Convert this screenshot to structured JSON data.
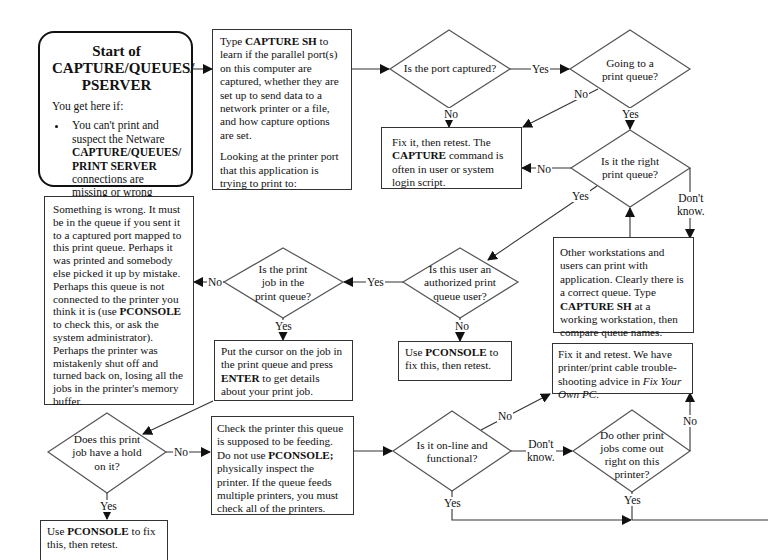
{
  "start": {
    "title_lines": [
      "Start of",
      "CAPTURE/QUEUES/",
      "PSERVER"
    ],
    "subtitle": "You get here if:",
    "bullet_pre": "You can't print and suspect the Netware ",
    "bullet_bold": "CAPTURE/QUEUES/ PRINT SERVER",
    "bullet_post": " connections are missing or wrong"
  },
  "capture_sh_box": {
    "p1_pre": "Type ",
    "p1_bold": "CAPTURE SH",
    "p1_post": " to learn if the parallel port(s) on this computer are captured, whether they are set up to send data to a network printer or a file, and how capture options are set.",
    "p2": "Looking at the printer port that this application is trying to print to:"
  },
  "diamonds": {
    "port_captured": "Is the port captured?",
    "going_to_queue": "Going to a print queue?",
    "right_queue": "Is it the right print queue?",
    "authorized_user": "Is this user an authorized print queue user?",
    "job_in_queue": "Is the print job in the print queue?",
    "job_hold": "Does this print job have a hold on it?",
    "online_functional": "Is it on-line and functional?",
    "other_jobs_ok": "Do other print jobs come out right on this printer?"
  },
  "boxes": {
    "fix_retest_capture": {
      "pre": "Fix it, then retest.  The ",
      "bold": "CAPTURE",
      "post": " command is often in user or system login script."
    },
    "other_workstations": {
      "pre": "Other workstations and users can print with application. Clearly there is a correct queue.  Type ",
      "bold": "CAPTURE SH",
      "post": " at a working workstation, then compare queue names."
    },
    "something_wrong": {
      "pre": "Something is wrong.  It must be in the queue if you sent it to a captured port mapped to this print queue.  Perhaps it was printed and somebody else picked it up by mistake. Perhaps this queue is not connected to the printer you think it is (use ",
      "bold": "PCONSOLE",
      "post": " to check this, or ask the system administrator). Perhaps the printer was mistakenly shut off and turned back on, losing all the jobs in the printer's memory buffer."
    },
    "put_cursor": {
      "pre": "Put the cursor on the job in the print queue and press ",
      "bold": "ENTER",
      "post": " to get details about your print job."
    },
    "pconsole_fix_user": {
      "pre": "Use ",
      "bold": "PCONSOLE",
      "post": " to fix this, then retest."
    },
    "fix_cable": {
      "pre": "Fix it and retest.  We have printer/print cable trouble-shooting advice in ",
      "italic": "Fix Your Own PC",
      "post": "."
    },
    "check_printer": {
      "pre": "Check the printer this queue is supposed to be feeding. Do not use ",
      "bold": "PCONSOLE;",
      "post": " physically inspect the printer. If the queue feeds multiple printers, you must check all of the printers."
    },
    "pconsole_fix_hold": {
      "pre": "Use ",
      "bold": "PCONSOLE",
      "post": " to fix this, then retest."
    }
  },
  "labels": {
    "yes": "Yes",
    "no": "No",
    "dont_know_1": "Don't",
    "dont_know_2": "know."
  }
}
